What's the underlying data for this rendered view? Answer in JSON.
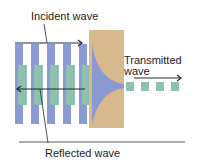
{
  "labels": {
    "incident": "Incident wave",
    "transmitted_line1": "Transmitted",
    "transmitted_line2": "wave",
    "reflected": "Reflected wave"
  },
  "colors": {
    "incident_bar": "#8a9bd4",
    "reflected_bar": "#8fbfae",
    "slab": "#d6b98c",
    "evanescent": "#8a9bd4",
    "transmitted_square": "#8fbfae",
    "arrow": "#1e2a3a",
    "baseline": "#333333"
  },
  "diagram": {
    "incident_bars": 5,
    "transmitted_squares": 4
  }
}
